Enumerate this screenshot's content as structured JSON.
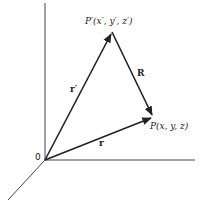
{
  "diagram": {
    "title": "",
    "labels": {
      "p_prime": "P′(x′, y′, z′)",
      "p": "P(x, y, z)",
      "R": "R",
      "r_prime": "r′",
      "r": "r",
      "origin": "0"
    },
    "points": {
      "origin": [
        45,
        160
      ],
      "p_prime": [
        112,
        32
      ],
      "p": [
        153,
        117
      ]
    },
    "colors": {
      "stroke": "#222222",
      "axis": "#444444"
    }
  }
}
